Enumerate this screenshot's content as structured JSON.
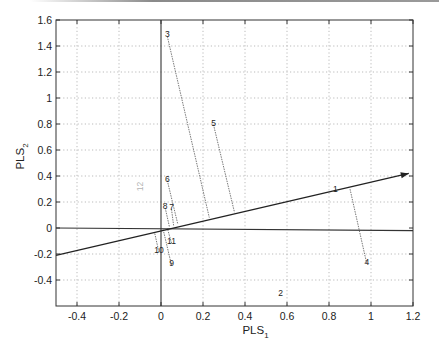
{
  "chart_data": {
    "type": "scatter",
    "title": "",
    "xlabel": "PLS",
    "xlabel_sub": "1",
    "ylabel": "PLS",
    "ylabel_sub": "2",
    "xlim": [
      -0.5,
      1.2
    ],
    "ylim": [
      -0.6,
      1.6
    ],
    "grid": true,
    "grid_style": "dotted",
    "legend": null,
    "x_ticks": [
      -0.4,
      -0.2,
      0,
      0.2,
      0.4,
      0.6,
      0.8,
      1,
      1.2
    ],
    "x_tick_labels": [
      "-0.4",
      "-0.2",
      "0",
      "0.2",
      "0.4",
      "0.6",
      "0.8",
      "1",
      "1.2"
    ],
    "y_ticks": [
      -0.4,
      -0.2,
      0,
      0.2,
      0.4,
      0.6,
      0.8,
      1,
      1.2,
      1.4,
      1.6
    ],
    "y_tick_labels": [
      "-0.4",
      "-0.2",
      "0",
      "0.2",
      "0.4",
      "0.6",
      "0.8",
      "1",
      "1.2",
      "1.4",
      "1.6"
    ],
    "reference_lines": [
      {
        "name": "vertical-axis",
        "x1": 0,
        "y1": 1.6,
        "x2": 0,
        "y2": -0.6
      },
      {
        "name": "horizontal-axis",
        "x1": -0.5,
        "y1": 0.0,
        "x2": 1.2,
        "y2": -0.02
      }
    ],
    "loading_vector": {
      "from": [
        -0.5,
        -0.21
      ],
      "to": [
        1.18,
        0.42
      ],
      "arrow": true
    },
    "points": [
      {
        "label": "1",
        "x": 0.83,
        "y": 0.3,
        "proj": null
      },
      {
        "label": "2",
        "x": 0.57,
        "y": -0.5,
        "proj": null
      },
      {
        "label": "3",
        "x": 0.03,
        "y": 1.49,
        "proj": [
          0.23,
          0.08
        ]
      },
      {
        "label": "4",
        "x": 0.98,
        "y": -0.26,
        "proj": [
          0.9,
          0.3
        ]
      },
      {
        "label": "5",
        "x": 0.25,
        "y": 0.81,
        "proj": [
          0.35,
          0.12
        ]
      },
      {
        "label": "6",
        "x": 0.03,
        "y": 0.38,
        "proj": [
          0.08,
          0.03
        ]
      },
      {
        "label": "7",
        "x": 0.05,
        "y": 0.16,
        "proj": [
          0.06,
          0.02
        ]
      },
      {
        "label": "8",
        "x": 0.02,
        "y": 0.17,
        "proj": [
          0.04,
          0.01
        ]
      },
      {
        "label": "9",
        "x": 0.05,
        "y": -0.27,
        "proj": [
          0.01,
          -0.01
        ]
      },
      {
        "label": "10",
        "x": -0.01,
        "y": -0.17,
        "proj": [
          -0.03,
          -0.04
        ]
      },
      {
        "label": "11",
        "x": 0.05,
        "y": -0.1,
        "proj": [
          0.03,
          0.0
        ]
      }
    ],
    "faint_marks": [
      {
        "label": "12",
        "x": -0.1,
        "y": 0.32,
        "opacity": 0.35
      }
    ]
  }
}
